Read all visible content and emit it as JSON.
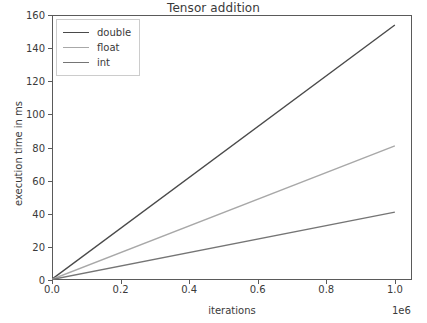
{
  "chart_data": {
    "type": "line",
    "title": "Tensor addition",
    "xlabel": "iterations",
    "ylabel": "execution time in ms",
    "x_offset_text": "1e6",
    "xlim": [
      0,
      1050000
    ],
    "ylim": [
      0,
      160
    ],
    "grid": false,
    "legend_position": "upper left",
    "x_ticks": [
      0.0,
      0.2,
      0.4,
      0.6,
      0.8,
      1.0
    ],
    "x_tick_labels": [
      "0.0",
      "0.2",
      "0.4",
      "0.6",
      "0.8",
      "1.0"
    ],
    "y_ticks": [
      0,
      20,
      40,
      60,
      80,
      100,
      120,
      140,
      160
    ],
    "y_tick_labels": [
      "0",
      "20",
      "40",
      "60",
      "80",
      "100",
      "120",
      "140",
      "160"
    ],
    "x": [
      0,
      1000000
    ],
    "series": [
      {
        "name": "double",
        "color": "#4a4a4a",
        "values": [
          0.5,
          154.0
        ]
      },
      {
        "name": "float",
        "color": "#a8a8a8",
        "values": [
          0.4,
          81.0
        ]
      },
      {
        "name": "int",
        "color": "#757575",
        "values": [
          0.3,
          41.0
        ]
      }
    ]
  },
  "legend": {
    "items": [
      {
        "label": "double"
      },
      {
        "label": "float"
      },
      {
        "label": "int"
      }
    ]
  },
  "colors": {
    "axis": "#5a5a5a",
    "text": "#3a3a3a",
    "background": "#ffffff",
    "legend_border": "#cccccc"
  }
}
